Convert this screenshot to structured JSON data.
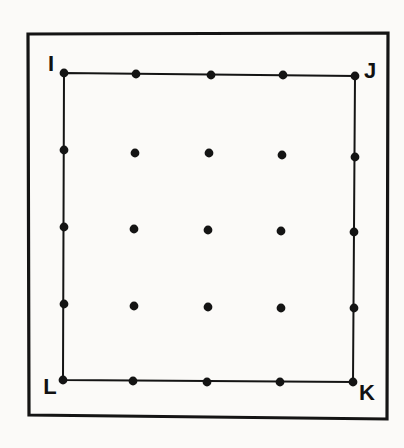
{
  "figure": {
    "background_color": "#fbfaf8",
    "ink_color": "#141414",
    "frame": {
      "name": "outer-frame",
      "stroke_width": 3.2,
      "corners": [
        {
          "x": 28,
          "y": 34
        },
        {
          "x": 388,
          "y": 33
        },
        {
          "x": 387,
          "y": 419
        },
        {
          "x": 29,
          "y": 415
        }
      ]
    },
    "square": {
      "name": "square-ijkl",
      "stroke_width": 2.0,
      "vertices": [
        {
          "label": "I",
          "x": 64,
          "y": 73
        },
        {
          "label": "J",
          "x": 355,
          "y": 76
        },
        {
          "label": "K",
          "x": 353,
          "y": 382
        },
        {
          "label": "L",
          "x": 63,
          "y": 380
        }
      ]
    },
    "labels": [
      {
        "name": "vertex-label-i",
        "text": "I",
        "x": 51,
        "y": 71,
        "anchor": "middle",
        "font_size": 22
      },
      {
        "name": "vertex-label-j",
        "text": "J",
        "x": 370,
        "y": 78,
        "anchor": "middle",
        "font_size": 22
      },
      {
        "name": "vertex-label-k",
        "text": "K",
        "x": 367,
        "y": 400,
        "anchor": "middle",
        "font_size": 22
      },
      {
        "name": "vertex-label-l",
        "text": "L",
        "x": 50,
        "y": 394,
        "anchor": "middle",
        "font_size": 22
      }
    ],
    "dot_radius": 4.4,
    "grid_rows": 5,
    "grid_cols": 5,
    "dots": [
      {
        "row": 0,
        "col": 0,
        "x": 64,
        "y": 73,
        "on_edge": true
      },
      {
        "row": 0,
        "col": 1,
        "x": 136,
        "y": 74,
        "on_edge": true
      },
      {
        "row": 0,
        "col": 2,
        "x": 211,
        "y": 75,
        "on_edge": true
      },
      {
        "row": 0,
        "col": 3,
        "x": 283,
        "y": 75,
        "on_edge": true
      },
      {
        "row": 0,
        "col": 4,
        "x": 355,
        "y": 76,
        "on_edge": true
      },
      {
        "row": 1,
        "col": 0,
        "x": 64,
        "y": 150,
        "on_edge": true
      },
      {
        "row": 1,
        "col": 1,
        "x": 135,
        "y": 153,
        "on_edge": false
      },
      {
        "row": 1,
        "col": 2,
        "x": 209,
        "y": 153,
        "on_edge": false
      },
      {
        "row": 1,
        "col": 3,
        "x": 282,
        "y": 155,
        "on_edge": false
      },
      {
        "row": 1,
        "col": 4,
        "x": 355,
        "y": 157,
        "on_edge": true
      },
      {
        "row": 2,
        "col": 0,
        "x": 64,
        "y": 227,
        "on_edge": true
      },
      {
        "row": 2,
        "col": 1,
        "x": 134,
        "y": 229,
        "on_edge": false
      },
      {
        "row": 2,
        "col": 2,
        "x": 208,
        "y": 230,
        "on_edge": false
      },
      {
        "row": 2,
        "col": 3,
        "x": 281,
        "y": 231,
        "on_edge": false
      },
      {
        "row": 2,
        "col": 4,
        "x": 354,
        "y": 232,
        "on_edge": true
      },
      {
        "row": 3,
        "col": 0,
        "x": 64,
        "y": 304,
        "on_edge": true
      },
      {
        "row": 3,
        "col": 1,
        "x": 134,
        "y": 306,
        "on_edge": false
      },
      {
        "row": 3,
        "col": 2,
        "x": 208,
        "y": 307,
        "on_edge": false
      },
      {
        "row": 3,
        "col": 3,
        "x": 281,
        "y": 308,
        "on_edge": false
      },
      {
        "row": 3,
        "col": 4,
        "x": 354,
        "y": 308,
        "on_edge": true
      },
      {
        "row": 4,
        "col": 0,
        "x": 63,
        "y": 380,
        "on_edge": true
      },
      {
        "row": 4,
        "col": 1,
        "x": 133,
        "y": 381,
        "on_edge": true
      },
      {
        "row": 4,
        "col": 2,
        "x": 207,
        "y": 382,
        "on_edge": true
      },
      {
        "row": 4,
        "col": 3,
        "x": 280,
        "y": 382,
        "on_edge": true
      },
      {
        "row": 4,
        "col": 4,
        "x": 353,
        "y": 382,
        "on_edge": true
      }
    ]
  }
}
